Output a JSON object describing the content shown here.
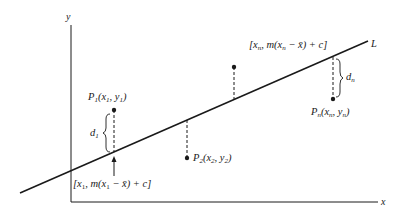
{
  "figure": {
    "colors": {
      "ink": "#1a1a1a",
      "background": "#ffffff"
    }
  },
  "axes": {
    "x_label": "x",
    "y_label": "y"
  },
  "line": {
    "label": "L",
    "x1": 20,
    "y1": 193,
    "x2": 368,
    "y2": 41
  },
  "points": [
    {
      "id": "P1",
      "name": "P",
      "sub": "1",
      "coord": "(x",
      "coord_sub": "1",
      "coord_mid": ", y",
      "coord_sub2": "1",
      "coord_end": ")",
      "px": 114,
      "py": 110,
      "line_y": 152
    },
    {
      "id": "P2",
      "name": "P",
      "sub": "2",
      "coord": "(x",
      "coord_sub": "2",
      "coord_mid": ", y",
      "coord_sub2": "2",
      "coord_end": ")",
      "px": 187,
      "py": 158,
      "line_y": 120
    },
    {
      "id": "P3",
      "px": 234,
      "py": 67,
      "line_y": 99
    },
    {
      "id": "Pn",
      "name": "P",
      "sub": "n",
      "coord": "(x",
      "coord_sub": "n",
      "coord_mid": ", y",
      "coord_sub2": "n",
      "coord_end": ")",
      "px": 333,
      "py": 99,
      "line_y": 57
    }
  ],
  "deviations": {
    "d1": {
      "main": "d",
      "sub": "1"
    },
    "dn": {
      "main": "d",
      "sub": "n"
    }
  },
  "line_point_labels": {
    "first": {
      "open": "[x",
      "sub1": "1",
      "mid": ", m(x",
      "sub2": "1",
      "end": " − x̄) + c]"
    },
    "last": {
      "open": "[x",
      "sub1": "n",
      "mid": ", m(x",
      "sub2": "n",
      "end": " − x̄) + c]"
    }
  }
}
